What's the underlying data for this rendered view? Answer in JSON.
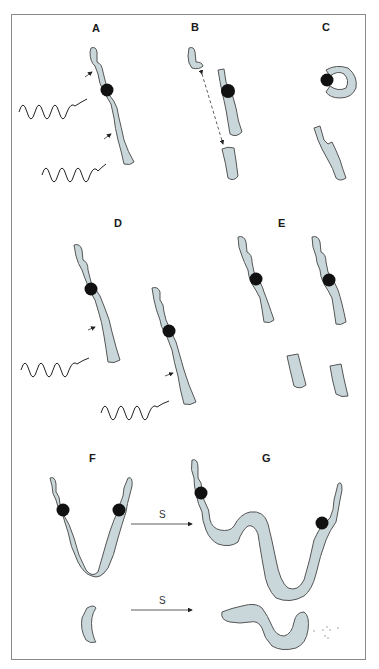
{
  "panels": {
    "A": {
      "label": "A"
    },
    "B": {
      "label": "B"
    },
    "C": {
      "label": "C"
    },
    "D": {
      "label": "D"
    },
    "E": {
      "label": "E"
    },
    "F": {
      "label": "F"
    },
    "G": {
      "label": "G"
    }
  },
  "arrows": {
    "fg_top": {
      "label": "S"
    },
    "fg_bottom": {
      "label": "S"
    }
  },
  "colors": {
    "chromosome_fill": "#c9d6da",
    "chromosome_stroke": "#555555",
    "centromere": "#111111",
    "frame": "#8a8a8a"
  }
}
